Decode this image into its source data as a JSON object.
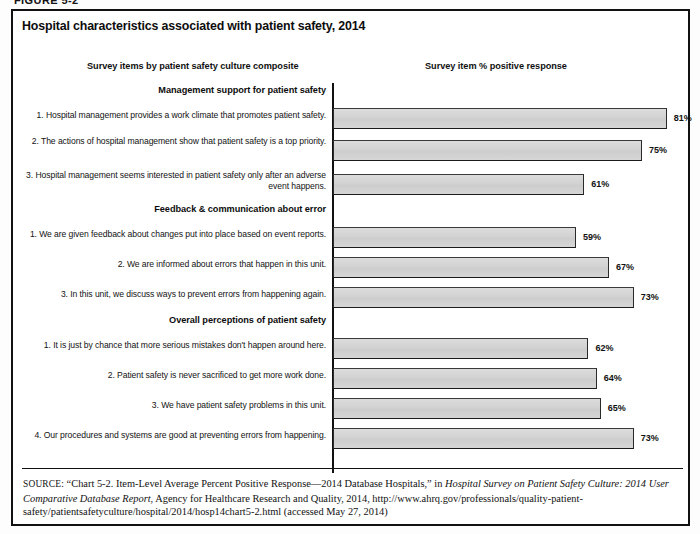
{
  "figure": {
    "number": "FIGURE 5-2",
    "title": "Hospital characteristics associated with patient safety, 2014"
  },
  "headers": {
    "left": "Survey items by patient safety culture composite",
    "right": "Survey item % positive response"
  },
  "chart_data": {
    "type": "bar",
    "orientation": "horizontal",
    "title": "Hospital characteristics associated with patient safety, 2014",
    "xlabel": "Survey item % positive response",
    "ylabel": "Survey items by patient safety culture composite",
    "xlim": [
      0,
      100
    ],
    "grid": false,
    "legend": null,
    "value_suffix": "%",
    "groups": [
      {
        "name": "Management support for patient safety",
        "items": [
          {
            "label": "1. Hospital management provides a work climate that promotes patient safety.",
            "value": 81,
            "value_label": "81%"
          },
          {
            "label": "2. The actions of hospital management show that patient safety is a top priority.",
            "value": 75,
            "value_label": "75%"
          },
          {
            "label": "3. Hospital management seems interested in patient safety only after an adverse event happens.",
            "value": 61,
            "value_label": "61%"
          }
        ]
      },
      {
        "name": "Feedback & communication about error",
        "items": [
          {
            "label": "1. We are given feedback about changes put into place based on event reports.",
            "value": 59,
            "value_label": "59%"
          },
          {
            "label": "2. We are informed about errors that happen in this unit.",
            "value": 67,
            "value_label": "67%"
          },
          {
            "label": "3. In this unit, we discuss ways to prevent errors from happening again.",
            "value": 73,
            "value_label": "73%"
          }
        ]
      },
      {
        "name": "Overall perceptions of patient safety",
        "items": [
          {
            "label": "1. It is just by chance that more serious mistakes don't happen around here.",
            "value": 62,
            "value_label": "62%"
          },
          {
            "label": "2. Patient safety is never sacrificed to get more work done.",
            "value": 64,
            "value_label": "64%"
          },
          {
            "label": "3. We have patient safety problems in this unit.",
            "value": 65,
            "value_label": "65%"
          },
          {
            "label": "4. Our procedures and systems are good at preventing errors from happening.",
            "value": 73,
            "value_label": "73%"
          }
        ]
      }
    ]
  },
  "source": {
    "keyword": "SOURCE:",
    "part1": " “Chart 5-2. Item-Level Average Percent Positive Response—2014 Database Hospitals,” in ",
    "italic1": "Hospital Survey on Patient Safety Culture: 2014 User Comparative Database Report",
    "part2": ", Agency for Healthcare Research and Quality, 2014, http://www.ahrq.gov/professionals/quality-patient-safety/patientsafetyculture/hospital/2014/hosp14chart5-2.html (accessed May 27, 2014)"
  },
  "colors": {
    "bar_fill": "#d4d4d4",
    "bar_border": "#2a2a2a",
    "frame": "#111111",
    "text": "#111111"
  }
}
